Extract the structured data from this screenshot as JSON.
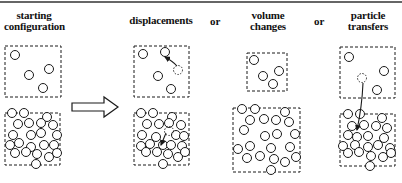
{
  "headers": {
    "starting": [
      "starting",
      "configuration"
    ],
    "displacements": "displacements",
    "or1": "or",
    "volume": [
      "volume",
      "changes"
    ],
    "or2": "or",
    "particle": [
      "particle",
      "transfers"
    ]
  },
  "colors": {
    "ink": "#1a1a1a",
    "background": "#ffffff"
  },
  "circle_radius": 4.5,
  "panels": [
    {
      "id": "starting",
      "top_box": {
        "x": 5,
        "y": 46,
        "w": 56,
        "h": 51
      },
      "top_circles": [
        [
          15,
          55
        ],
        [
          49,
          69
        ],
        [
          29,
          75
        ],
        [
          43,
          88
        ]
      ],
      "bottom_box": {
        "x": 5,
        "y": 113,
        "w": 55,
        "h": 52
      },
      "bottom_circles": [
        [
          12,
          113
        ],
        [
          24,
          113
        ],
        [
          47,
          117
        ],
        [
          18,
          124
        ],
        [
          29,
          123
        ],
        [
          41,
          123
        ],
        [
          53,
          125
        ],
        [
          13,
          135
        ],
        [
          31,
          135
        ],
        [
          41,
          133
        ],
        [
          57,
          135
        ],
        [
          10,
          145
        ],
        [
          19,
          143
        ],
        [
          31,
          147
        ],
        [
          44,
          145
        ],
        [
          54,
          145
        ],
        [
          15,
          153
        ],
        [
          26,
          152
        ],
        [
          37,
          154
        ],
        [
          49,
          157
        ],
        [
          57,
          153
        ],
        [
          36,
          164
        ]
      ]
    },
    {
      "id": "displacements",
      "top_box": {
        "x": 134,
        "y": 46,
        "w": 55,
        "h": 51
      },
      "top_circles": [
        [
          143,
          54
        ],
        [
          165,
          52
        ],
        [
          158,
          76
        ],
        [
          171,
          89
        ]
      ],
      "ghost_circle": [
        178,
        70
      ],
      "arrow": {
        "from": [
          177,
          66
        ],
        "to": [
          165,
          57
        ]
      },
      "bottom_box": {
        "x": 134,
        "y": 113,
        "w": 55,
        "h": 52
      },
      "bottom_circles": [
        [
          141,
          113
        ],
        [
          153,
          113
        ],
        [
          172,
          117
        ],
        [
          147,
          124
        ],
        [
          159,
          124
        ],
        [
          169,
          123
        ],
        [
          181,
          125
        ],
        [
          142,
          135
        ],
        [
          156,
          137
        ],
        [
          176,
          135
        ],
        [
          184,
          136
        ],
        [
          141,
          146
        ],
        [
          150,
          144
        ],
        [
          163,
          145
        ],
        [
          171,
          145
        ],
        [
          182,
          146
        ],
        [
          146,
          152
        ],
        [
          157,
          152
        ],
        [
          168,
          154
        ],
        [
          178,
          157
        ],
        [
          185,
          152
        ],
        [
          163,
          164
        ]
      ],
      "ghost_bottom": [
        169,
        131
      ],
      "arrow_bottom": {
        "from": [
          166,
          133
        ],
        "to": [
          161,
          145
        ]
      }
    },
    {
      "id": "volume",
      "top_box": {
        "x": 247,
        "y": 53,
        "w": 40,
        "h": 38
      },
      "top_circles": [
        [
          254,
          60
        ],
        [
          263,
          76
        ],
        [
          279,
          71
        ],
        [
          273,
          84
        ]
      ],
      "bottom_box": {
        "x": 233,
        "y": 108,
        "w": 67,
        "h": 64
      },
      "bottom_circles": [
        [
          242,
          109
        ],
        [
          255,
          109
        ],
        [
          285,
          112
        ],
        [
          250,
          120
        ],
        [
          264,
          119
        ],
        [
          276,
          120
        ],
        [
          289,
          122
        ],
        [
          244,
          130
        ],
        [
          265,
          136
        ],
        [
          277,
          134
        ],
        [
          295,
          134
        ],
        [
          238,
          149
        ],
        [
          250,
          146
        ],
        [
          271,
          148
        ],
        [
          290,
          147
        ],
        [
          247,
          158
        ],
        [
          260,
          156
        ],
        [
          274,
          159
        ],
        [
          285,
          162
        ],
        [
          296,
          157
        ],
        [
          271,
          170
        ]
      ]
    },
    {
      "id": "particle",
      "top_box": {
        "x": 340,
        "y": 47,
        "w": 55,
        "h": 51
      },
      "top_circles": [
        [
          349,
          57
        ],
        [
          384,
          71
        ],
        [
          377,
          90
        ]
      ],
      "ghost_circle": [
        362,
        78
      ],
      "arrow": {
        "from": [
          363,
          83
        ],
        "to": [
          357,
          130
        ]
      },
      "bottom_box": {
        "x": 340,
        "y": 114,
        "w": 55,
        "h": 52
      },
      "bottom_circles": [
        [
          348,
          114
        ],
        [
          360,
          114
        ],
        [
          382,
          118
        ],
        [
          352,
          126
        ],
        [
          364,
          125
        ],
        [
          376,
          126
        ],
        [
          387,
          128
        ],
        [
          348,
          135
        ],
        [
          357,
          137
        ],
        [
          368,
          136
        ],
        [
          384,
          138
        ],
        [
          343,
          146
        ],
        [
          355,
          145
        ],
        [
          368,
          147
        ],
        [
          378,
          145
        ],
        [
          390,
          148
        ],
        [
          348,
          153
        ],
        [
          359,
          152
        ],
        [
          371,
          156
        ],
        [
          383,
          157
        ],
        [
          391,
          153
        ],
        [
          370,
          166
        ]
      ]
    }
  ],
  "transition_arrow": {
    "x1": 72,
    "x2": 118,
    "y": 107
  }
}
